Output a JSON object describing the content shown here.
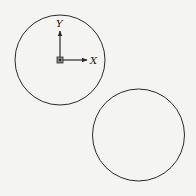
{
  "diagram": {
    "circles": [
      {
        "id": "circle-a",
        "has_frame": true
      },
      {
        "id": "circle-b",
        "has_frame": false
      }
    ],
    "frame": {
      "x_label": "X",
      "y_label": "Y",
      "origin_marker": "square-dot"
    },
    "colors": {
      "stroke": "#2a2a2a",
      "background": "#f4f4f2"
    }
  }
}
